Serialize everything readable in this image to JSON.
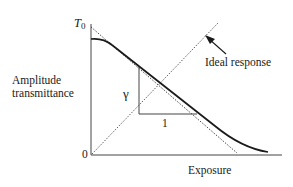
{
  "diagram": {
    "y_axis": {
      "label_lines": [
        "Amplitude",
        "transmittance"
      ],
      "top_tick_label": "T",
      "top_tick_subscript": "0",
      "origin_label": "0"
    },
    "x_axis": {
      "label": "Exposure"
    },
    "annotations": {
      "ideal_response_label": "Ideal response",
      "slope_vertical_label": "γ",
      "slope_horizontal_label": "1"
    },
    "elements": {
      "characteristic_curve": "solid thick curve from T0 plateau descending linearly then tailing off",
      "tangent_line": "dotted line tangent to linear region, from T0 to x-axis",
      "ideal_response_line": "dashed diagonal line from origin upward",
      "slope_triangle": "right triangle under linear region showing slope γ over run 1",
      "arrow": "arrow pointing to ideal response line"
    },
    "colors": {
      "line": "#1a1a1a",
      "axis": "#444444",
      "background": "#ffffff"
    }
  }
}
